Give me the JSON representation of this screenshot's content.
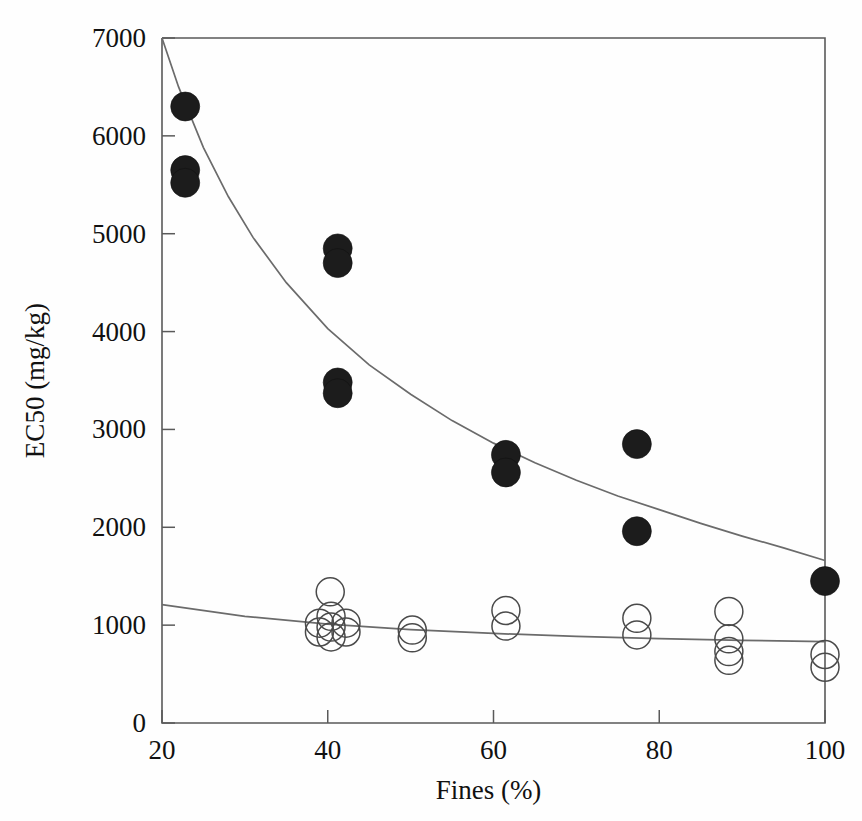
{
  "chart_data": {
    "type": "scatter",
    "title": "",
    "xlabel": "Fines (%)",
    "ylabel": "EC50 (mg/kg)",
    "xlim": [
      20,
      100
    ],
    "ylim": [
      0,
      7000
    ],
    "xticks": [
      20,
      40,
      60,
      80,
      100
    ],
    "yticks": [
      0,
      1000,
      2000,
      3000,
      4000,
      5000,
      6000,
      7000
    ],
    "xtick_labels": [
      "20",
      "40",
      "60",
      "80",
      "100"
    ],
    "ytick_labels": [
      "0",
      "1000",
      "2000",
      "3000",
      "4000",
      "5000",
      "6000",
      "7000"
    ],
    "grid": false,
    "legend": "none",
    "series": [
      {
        "name": "filled-circles",
        "marker": "filled circle",
        "color": "#1c1c1c",
        "points": [
          {
            "x": 22.8,
            "y": 6300
          },
          {
            "x": 22.8,
            "y": 5650
          },
          {
            "x": 22.8,
            "y": 5520
          },
          {
            "x": 41.2,
            "y": 4850
          },
          {
            "x": 41.2,
            "y": 4700
          },
          {
            "x": 41.2,
            "y": 3480
          },
          {
            "x": 41.2,
            "y": 3370
          },
          {
            "x": 61.5,
            "y": 2740
          },
          {
            "x": 61.5,
            "y": 2560
          },
          {
            "x": 77.3,
            "y": 2850
          },
          {
            "x": 77.3,
            "y": 1960
          },
          {
            "x": 100.0,
            "y": 1450
          }
        ]
      },
      {
        "name": "open-circles",
        "marker": "open circle",
        "color": "#4a4a4a",
        "points": [
          {
            "x": 40.3,
            "y": 1340
          },
          {
            "x": 39.0,
            "y": 1020
          },
          {
            "x": 39.0,
            "y": 930
          },
          {
            "x": 40.4,
            "y": 1090
          },
          {
            "x": 40.4,
            "y": 980
          },
          {
            "x": 40.4,
            "y": 880
          },
          {
            "x": 42.2,
            "y": 1020
          },
          {
            "x": 42.2,
            "y": 930
          },
          {
            "x": 50.2,
            "y": 950
          },
          {
            "x": 50.2,
            "y": 870
          },
          {
            "x": 61.5,
            "y": 1150
          },
          {
            "x": 61.5,
            "y": 990
          },
          {
            "x": 77.3,
            "y": 1070
          },
          {
            "x": 77.3,
            "y": 900
          },
          {
            "x": 88.4,
            "y": 1140
          },
          {
            "x": 88.4,
            "y": 860
          },
          {
            "x": 88.4,
            "y": 730
          },
          {
            "x": 88.4,
            "y": 640
          },
          {
            "x": 100.0,
            "y": 700
          },
          {
            "x": 100.0,
            "y": 570
          }
        ]
      }
    ],
    "fit_curves": [
      {
        "name": "upper-fit",
        "for_series": "filled-circles",
        "description": "decaying power/exponential fit through filled circles",
        "points": [
          {
            "x": 20.0,
            "y": 7000
          },
          {
            "x": 22.0,
            "y": 6500
          },
          {
            "x": 25.0,
            "y": 5880
          },
          {
            "x": 28.0,
            "y": 5380
          },
          {
            "x": 31.0,
            "y": 4960
          },
          {
            "x": 35.0,
            "y": 4500
          },
          {
            "x": 40.0,
            "y": 4030
          },
          {
            "x": 45.0,
            "y": 3660
          },
          {
            "x": 50.0,
            "y": 3360
          },
          {
            "x": 55.0,
            "y": 3090
          },
          {
            "x": 60.0,
            "y": 2860
          },
          {
            "x": 65.0,
            "y": 2660
          },
          {
            "x": 70.0,
            "y": 2480
          },
          {
            "x": 75.0,
            "y": 2320
          },
          {
            "x": 80.0,
            "y": 2180
          },
          {
            "x": 85.0,
            "y": 2040
          },
          {
            "x": 90.0,
            "y": 1910
          },
          {
            "x": 95.0,
            "y": 1790
          },
          {
            "x": 100.0,
            "y": 1660
          }
        ]
      },
      {
        "name": "lower-fit",
        "for_series": "open-circles",
        "description": "shallow decaying fit through open circles",
        "points": [
          {
            "x": 20.0,
            "y": 1210
          },
          {
            "x": 30.0,
            "y": 1090
          },
          {
            "x": 40.0,
            "y": 1010
          },
          {
            "x": 50.0,
            "y": 955
          },
          {
            "x": 60.0,
            "y": 915
          },
          {
            "x": 70.0,
            "y": 885
          },
          {
            "x": 80.0,
            "y": 862
          },
          {
            "x": 90.0,
            "y": 845
          },
          {
            "x": 100.0,
            "y": 832
          }
        ]
      }
    ]
  },
  "geometry": {
    "plot_left": 162,
    "plot_right": 825,
    "plot_top": 38,
    "plot_bottom": 723
  }
}
